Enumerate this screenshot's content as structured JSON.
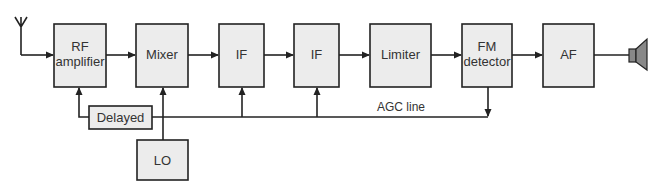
{
  "diagram": {
    "blocks": {
      "rf_amplifier": {
        "line1": "RF",
        "line2": "amplifier"
      },
      "mixer": {
        "label": "Mixer"
      },
      "if1": {
        "label": "IF"
      },
      "if2": {
        "label": "IF"
      },
      "limiter": {
        "label": "Limiter"
      },
      "fm_detector": {
        "line1": "FM",
        "line2": "detector"
      },
      "af": {
        "label": "AF"
      },
      "delayed": {
        "label": "Delayed"
      },
      "lo": {
        "label": "LO"
      }
    },
    "labels": {
      "agc_line": "AGC line"
    },
    "icons": {
      "input": "antenna-icon",
      "output": "speaker-icon"
    },
    "colors": {
      "block_fill": "#ececec",
      "stroke": "#222222",
      "text": "#333333",
      "speaker_fill": "#888888"
    }
  }
}
